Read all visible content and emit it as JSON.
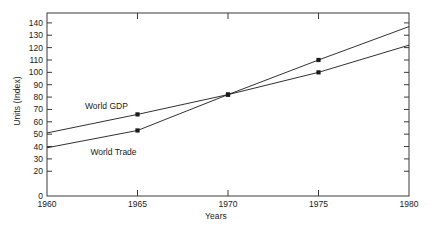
{
  "chart_data": {
    "type": "line",
    "title": "",
    "xlabel": "Years",
    "ylabel": "Units (Index)",
    "x": [
      1960,
      1965,
      1970,
      1975,
      1980
    ],
    "xlim": [
      1960,
      1980
    ],
    "ylim": [
      0,
      148
    ],
    "xticks": [
      "1960",
      "1965",
      "1970",
      "1975",
      "1980"
    ],
    "yticks": [
      "0",
      "20",
      "30",
      "40",
      "50",
      "60",
      "70",
      "80",
      "90",
      "100",
      "110",
      "120",
      "130",
      "140"
    ],
    "ytick_values": [
      0,
      20,
      30,
      40,
      50,
      60,
      70,
      80,
      90,
      100,
      110,
      120,
      130,
      140
    ],
    "grid": false,
    "legend": "inline-labels",
    "frame": "box",
    "tick_direction": "in",
    "series": [
      {
        "name": "World GDP",
        "values": [
          51,
          66,
          82,
          100,
          122
        ],
        "color": "#1a1a1a",
        "marker_x": [
          1965,
          1970,
          1975
        ],
        "marker_y": [
          66,
          82,
          100
        ],
        "label_x": 1962.1,
        "label_y": 70
      },
      {
        "name": "World Trade",
        "values": [
          39,
          53,
          82,
          110,
          137
        ],
        "color": "#1a1a1a",
        "marker_x": [
          1965,
          1970,
          1975
        ],
        "marker_y": [
          53,
          82,
          110
        ],
        "label_x": 1962.4,
        "label_y": 33
      }
    ]
  },
  "axes": {
    "ylabel_text": "Units (Index)",
    "xlabel_text": "Years"
  },
  "colors": {
    "line": "#1a1a1a",
    "frame": "#3a3a3a",
    "background": "#ffffff",
    "text": "#1a1a1a"
  }
}
